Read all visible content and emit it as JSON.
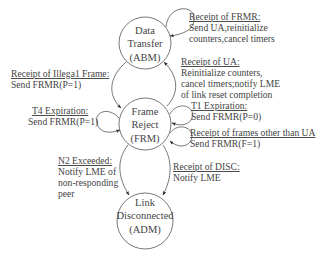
{
  "diagram": {
    "type": "state-transition",
    "states": [
      {
        "id": "abm",
        "lines": [
          "Data",
          "Transfer",
          "(ABM)"
        ]
      },
      {
        "id": "frm",
        "lines": [
          "Frame",
          "Reject",
          "(FRM)"
        ]
      },
      {
        "id": "adm",
        "lines": [
          "Link",
          "Disconnected",
          "(ADM)"
        ]
      }
    ],
    "transitions": [
      {
        "id": "abm_self",
        "from": "abm",
        "to": "abm",
        "title": "Receipt of FRMR:",
        "actions": [
          "Send UA,reinitialize",
          "counters,cancel timers"
        ]
      },
      {
        "id": "abm_to_frm",
        "from": "abm",
        "to": "frm",
        "title": "Receipt of Illega1 Frame:",
        "actions": [
          "Send FRMR(P=1)"
        ]
      },
      {
        "id": "frm_to_abm",
        "from": "frm",
        "to": "abm",
        "title": "Receipt of UA:",
        "actions": [
          "Reinitialize counters,",
          "cancel timers;notify LME",
          "of link reset completion"
        ]
      },
      {
        "id": "frm_self_t4",
        "from": "frm",
        "to": "frm",
        "title": "T4 Expiration:",
        "actions": [
          "Send FRMR(P=1)"
        ]
      },
      {
        "id": "frm_self_t1",
        "from": "frm",
        "to": "frm",
        "title": "T1 Expiration:",
        "actions": [
          "Send FRMR(P=0)"
        ]
      },
      {
        "id": "frm_self_other",
        "from": "frm",
        "to": "frm",
        "title": "Receipt of frames other than UA",
        "actions": [
          "Send FRMR(F=1)"
        ]
      },
      {
        "id": "frm_to_adm_n2",
        "from": "frm",
        "to": "adm",
        "title": "N2 Exceeded:",
        "actions": [
          "Notify LME of",
          "non-responding",
          "peer"
        ]
      },
      {
        "id": "frm_to_adm_disc",
        "from": "frm",
        "to": "adm",
        "title": "Receipt of DISC:",
        "actions": [
          "Notify LME"
        ]
      }
    ]
  }
}
